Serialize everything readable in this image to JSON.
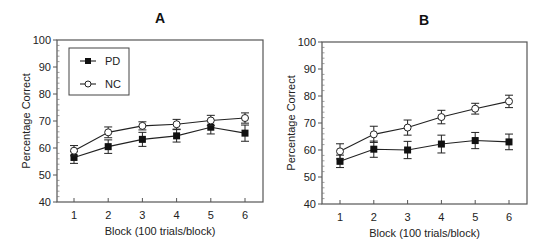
{
  "chart_data": [
    {
      "type": "line",
      "panel": "A",
      "title": "A",
      "xlabel": "Block (100 trials/block)",
      "ylabel": "Percentage Correct",
      "categories": [
        "1",
        "2",
        "3",
        "4",
        "5",
        "6"
      ],
      "x": [
        1,
        2,
        3,
        4,
        5,
        6
      ],
      "xlim": [
        0.5,
        6.75
      ],
      "ylim": [
        40,
        100
      ],
      "yticks": [
        40,
        50,
        60,
        70,
        80,
        90,
        100
      ],
      "grid": false,
      "legend": {
        "placement": "top-left",
        "boxed": true
      },
      "series": [
        {
          "name": "PD",
          "marker": "filled-square",
          "values": [
            56.5,
            60.5,
            63.2,
            64.5,
            67.7,
            65.5
          ],
          "errors": [
            2.2,
            2.5,
            2.6,
            2.3,
            2.5,
            3.0
          ]
        },
        {
          "name": "NC",
          "marker": "open-circle",
          "values": [
            59,
            65.8,
            68.2,
            68.8,
            70.2,
            71.1
          ],
          "errors": [
            1.9,
            2.0,
            1.5,
            1.8,
            1.9,
            1.9
          ]
        }
      ]
    },
    {
      "type": "line",
      "panel": "B",
      "title": "B",
      "xlabel": "Block (100 trials/block)",
      "ylabel": "Percentage Correct",
      "categories": [
        "1",
        "2",
        "3",
        "4",
        "5",
        "6"
      ],
      "x": [
        1,
        2,
        3,
        4,
        5,
        6
      ],
      "xlim": [
        0.5,
        6.65
      ],
      "ylim": [
        40,
        100
      ],
      "yticks": [
        40,
        50,
        60,
        70,
        80,
        90,
        100
      ],
      "grid": false,
      "legend": null,
      "series": [
        {
          "name": "PD",
          "marker": "filled-square",
          "values": [
            55.8,
            60.3,
            60.0,
            62.2,
            63.5,
            63.0
          ],
          "errors": [
            2.3,
            3.0,
            3.2,
            3.3,
            3.0,
            2.9
          ]
        },
        {
          "name": "NC",
          "marker": "open-circle",
          "values": [
            59.5,
            65.8,
            68.3,
            72.2,
            75.3,
            78.0
          ],
          "errors": [
            2.8,
            3.0,
            2.8,
            2.5,
            2.0,
            2.3
          ]
        }
      ]
    }
  ]
}
